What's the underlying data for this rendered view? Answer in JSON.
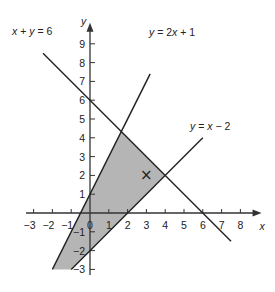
{
  "chart_data": {
    "type": "line",
    "title": "",
    "xlabel": "x",
    "ylabel": "y",
    "xlim": [
      -3.5,
      8.8
    ],
    "ylim": [
      -3.3,
      9.8
    ],
    "grid": false,
    "x_ticks": [
      "-3",
      "-2",
      "-1",
      "0",
      "1",
      "2",
      "3",
      "4",
      "5",
      "6",
      "7",
      "8"
    ],
    "y_ticks": [
      "-3",
      "-2",
      "-1",
      "1",
      "2",
      "3",
      "4",
      "5",
      "6",
      "7",
      "8",
      "9"
    ],
    "series": [
      {
        "name": "x + y = 6",
        "equation": "y = 6 - x",
        "x": [
          -2.5,
          7.5
        ],
        "y": [
          8.5,
          -1.5
        ]
      },
      {
        "name": "y = 2x + 1",
        "equation": "y = 2x + 1",
        "x": [
          -2,
          3.2
        ],
        "y": [
          -3,
          7.4
        ]
      },
      {
        "name": "y = x - 2",
        "equation": "y = x - 2",
        "x": [
          -1,
          6
        ],
        "y": [
          -3,
          4
        ]
      }
    ],
    "shaded_region": {
      "description": "Feasible region: y <= 2x+1, y >= x-2, x + y <= 6, bounded below at y = -3",
      "vertices": [
        [
          -2,
          -3
        ],
        [
          1.6667,
          4.3333
        ],
        [
          4,
          2
        ],
        [
          -1,
          -3
        ]
      ],
      "color": "#b5b5b5"
    },
    "annotations": [
      {
        "type": "marker",
        "symbol": "×",
        "x": 3,
        "y": 2
      }
    ],
    "legend": []
  },
  "labels": {
    "line1": "x + y = 6",
    "line2": "y = 2x + 1",
    "line3": "y = x − 2",
    "xaxis": "x",
    "yaxis": "y",
    "marker": "×"
  }
}
